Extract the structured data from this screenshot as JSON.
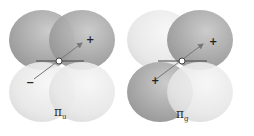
{
  "diagrams": [
    {
      "id": "pi-u",
      "label_symbol": "π",
      "label_subscript": "u",
      "lobes": {
        "top_left": "dark",
        "top_right": "dark",
        "bottom_left": "light",
        "bottom_right": "light"
      },
      "tip_sign": "+",
      "tail_sign": "−"
    },
    {
      "id": "pi-g",
      "label_symbol": "π",
      "label_subscript": "g",
      "lobes": {
        "top_left": "light",
        "top_right": "dark",
        "bottom_left": "dark",
        "bottom_right": "light"
      },
      "tip_sign": "+",
      "tail_sign": "+"
    }
  ],
  "colors": {
    "dark": "#a9a9a9",
    "light": "#e6e6e6",
    "axis": "#444444",
    "arrow": "#777777"
  }
}
